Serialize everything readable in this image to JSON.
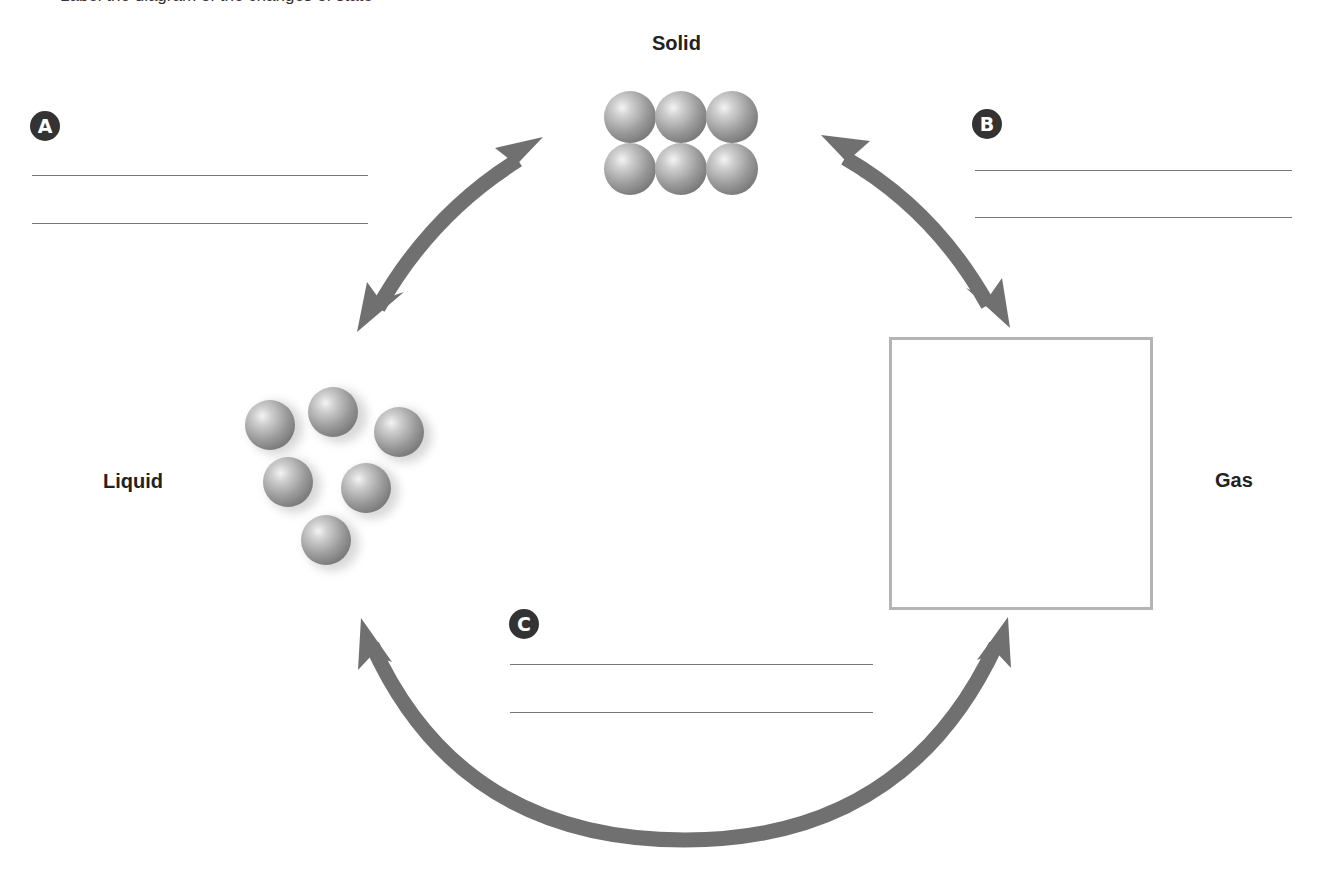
{
  "instruction_clipped": "Label the diagram of the changes of state",
  "states": {
    "solid": {
      "label": "Solid",
      "particle_count": 6,
      "arrangement": "tightly packed 3x2 grid"
    },
    "liquid": {
      "label": "Liquid",
      "particle_count": 6,
      "arrangement": "loosely clustered, blurred (moving)"
    },
    "gas": {
      "label": "Gas",
      "particle_count": 0,
      "arrangement": "empty box to draw particles"
    }
  },
  "blanks": [
    {
      "badge": "A",
      "between": "Solid ↔ Liquid",
      "lines": 2
    },
    {
      "badge": "B",
      "between": "Solid ↔ Gas",
      "lines": 2
    },
    {
      "badge": "C",
      "between": "Liquid ↔ Gas",
      "lines": 2
    }
  ],
  "arrows": [
    {
      "name": "solid-liquid-arrow",
      "type": "double-headed"
    },
    {
      "name": "solid-gas-arrow",
      "type": "double-headed"
    },
    {
      "name": "liquid-gas-arrow",
      "type": "double-headed"
    }
  ],
  "colors": {
    "arrow": "#707070",
    "badge": "#333333",
    "line": "#777777",
    "box_border": "#b4b4b4",
    "particle_base": "#9a9a9a"
  }
}
